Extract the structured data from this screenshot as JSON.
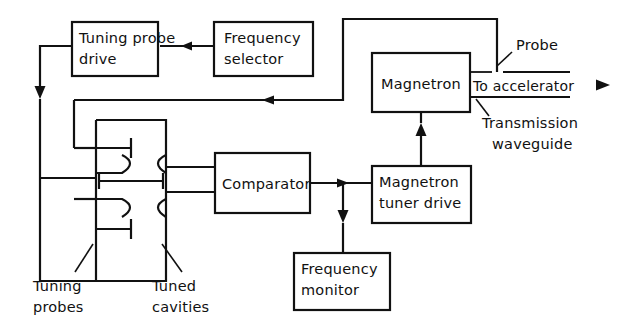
{
  "diagram": {
    "ink_color": "#111111",
    "background_color": "#ffffff",
    "blocks": [
      {
        "id": "tuning-probe-drive",
        "line1": "Tuning probe",
        "line2": "drive"
      },
      {
        "id": "frequency-selector",
        "line1": "Frequency",
        "line2": "selector"
      },
      {
        "id": "magnetron",
        "line1": "Magnetron",
        "line2": ""
      },
      {
        "id": "comparator",
        "line1": "Comparator",
        "line2": ""
      },
      {
        "id": "magnetron-tuner-drive",
        "line1": "Magnetron",
        "line2": "tuner drive"
      },
      {
        "id": "frequency-monitor",
        "line1": "Frequency",
        "line2": "monitor"
      }
    ],
    "annotations": [
      {
        "id": "probe",
        "text": "Probe"
      },
      {
        "id": "to-accelerator",
        "text": "To accelerator"
      },
      {
        "id": "transmission-waveguide",
        "line1": "Transmission",
        "line2": "waveguide"
      },
      {
        "id": "tuning-probes",
        "line1": "Tuning",
        "line2": "probes"
      },
      {
        "id": "tuned-cavities",
        "line1": "Tuned",
        "line2": "cavities"
      }
    ],
    "signal_flow": [
      "Frequency selector -> Tuning probe drive",
      "Tuning probe drive -> Tuning probes / Tuned cavities",
      "Tuned cavities -> Comparator (two inputs)",
      "Comparator -> Magnetron tuner drive",
      "Comparator -> Frequency monitor",
      "Magnetron tuner drive -> Magnetron",
      "Probe on transmission waveguide -> Tuned cavities (feedback)",
      "Magnetron -> Transmission waveguide -> To accelerator"
    ]
  }
}
